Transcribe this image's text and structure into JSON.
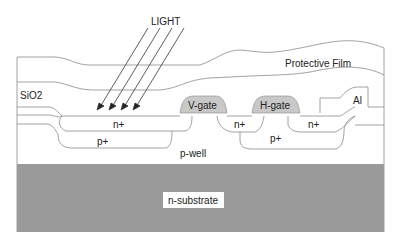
{
  "diagram": {
    "labels": {
      "light": "LIGHT",
      "protective_film": "Protective Film",
      "sio2": "SiO2",
      "v_gate": "V-gate",
      "h_gate": "H-gate",
      "al": "Al",
      "n_plus_left": "n+",
      "n_plus_mid": "n+",
      "n_plus_right": "n+",
      "p_plus_left": "p+",
      "p_plus_right": "p+",
      "p_well": "p-well",
      "n_substrate": "n-substrate"
    },
    "colors": {
      "substrate": "#9a9a9a",
      "gate": "#c8c8c8",
      "line": "#8a8a8a",
      "text": "#222222"
    },
    "light_rays": 4
  }
}
